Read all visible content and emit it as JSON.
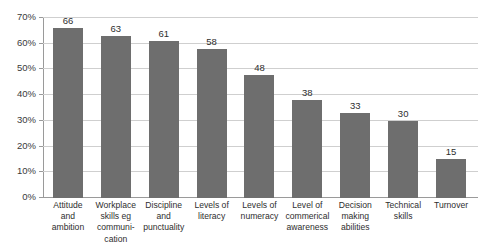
{
  "chart_data": {
    "type": "bar",
    "title": "",
    "subtitle": "",
    "xlabel": "",
    "ylabel": "",
    "ylim": [
      0,
      70
    ],
    "ytick_step": 10,
    "ytick_labels": [
      "70%",
      "60%",
      "50%",
      "40%",
      "30%",
      "20%",
      "10%",
      "0%"
    ],
    "ytick_values": [
      70,
      60,
      50,
      40,
      30,
      20,
      10,
      0
    ],
    "grid": true,
    "legend": false,
    "legend_position": "none",
    "bar_color": "#6e6e6e",
    "gridline_color": "#cfcfcf",
    "axis_color": "#9a9a9a",
    "categories": [
      "Attitude and ambition",
      "Workplace skills eg communication",
      "Discipline and punctuality",
      "Levels of literacy",
      "Levels of numeracy",
      "Level of commerical awareness",
      "Decision making abilities",
      "Technical skills",
      "Turnover"
    ],
    "category_lines": [
      [
        "Attitude",
        "and",
        "ambition"
      ],
      [
        "Workplace",
        "skills eg",
        "communi-",
        "cation"
      ],
      [
        "Discipline",
        "and",
        "punctuality"
      ],
      [
        "Levels of",
        "literacy"
      ],
      [
        "Levels of",
        "numeracy"
      ],
      [
        "Level of",
        "commerical",
        "awareness"
      ],
      [
        "Decision",
        "making",
        "abilities"
      ],
      [
        "Technical",
        "skills"
      ],
      [
        "Turnover"
      ]
    ],
    "values": [
      66,
      63,
      61,
      58,
      48,
      38,
      33,
      30,
      15
    ],
    "value_labels": [
      "66",
      "63",
      "61",
      "58",
      "48",
      "38",
      "33",
      "30",
      "15"
    ]
  }
}
